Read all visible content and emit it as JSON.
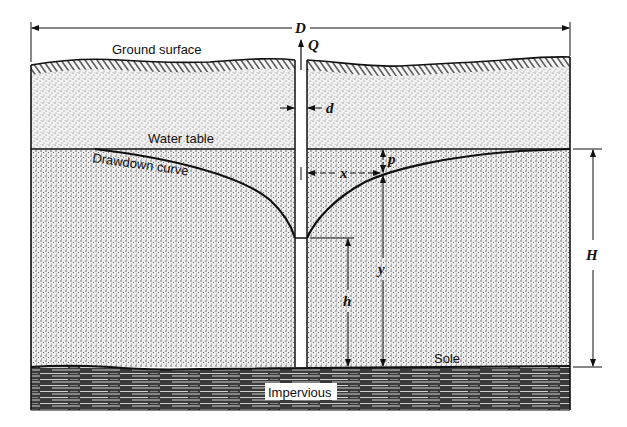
{
  "diagram": {
    "labels": {
      "ground_surface": "Ground surface",
      "water_table": "Water table",
      "drawdown_curve": "Drawdown curve",
      "sole": "Sole",
      "impervious": "Impervious"
    },
    "variables": {
      "D": "D",
      "Q": "Q",
      "d": "d",
      "x": "x",
      "p": "p",
      "y": "y",
      "h": "h",
      "H": "H"
    },
    "colors": {
      "ink": "#111111",
      "background": "#ffffff",
      "sand_fill": "#e6e6e6",
      "impervious_fill": "#2a2a2a"
    }
  }
}
